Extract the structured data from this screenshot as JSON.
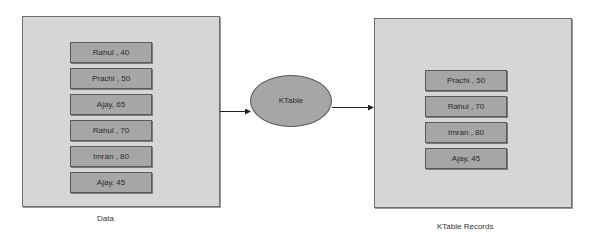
{
  "source_panel": {
    "caption": "Data",
    "records": [
      "Rahul , 40",
      "Prachi , 50",
      "Ajay, 65",
      "Rahul , 70",
      "Imran , 80",
      "Ajay, 45"
    ]
  },
  "processor": {
    "label": "KTable"
  },
  "result_panel": {
    "caption": "KTable Records",
    "records": [
      "Prachi , 50",
      "Rahul , 70",
      "Imran , 80",
      "Ajay, 45"
    ]
  },
  "colors": {
    "panel": "#d6d6d6",
    "record": "#a6a6a6",
    "border": "#5a5a5a"
  }
}
